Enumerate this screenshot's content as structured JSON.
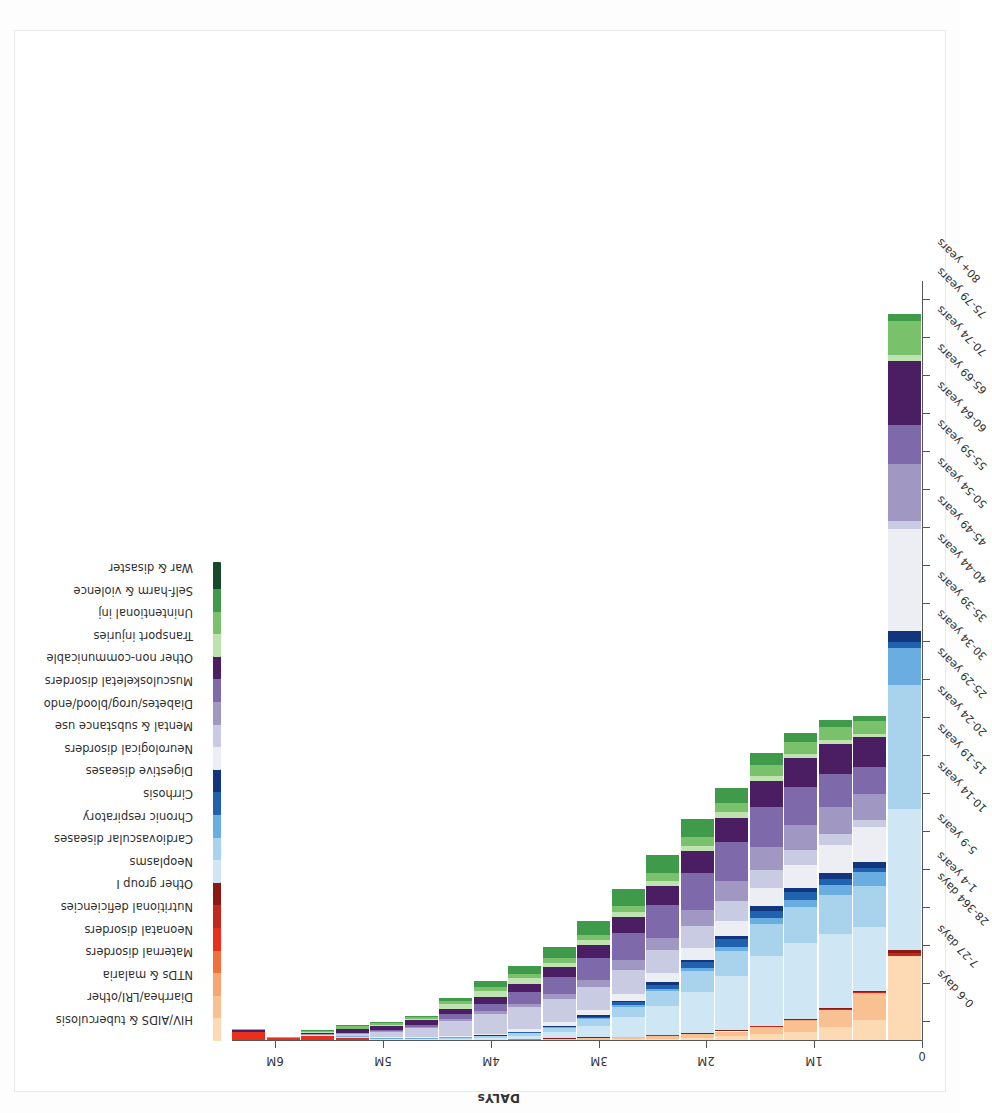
{
  "figure": {
    "title": "Japan, Both sexes, 2010",
    "value_axis_title": "DALYs",
    "value_axis_ticks": [
      "0",
      "1M",
      "2M",
      "3M",
      "4M",
      "5M",
      "6M"
    ]
  },
  "chart_data": {
    "type": "bar",
    "title": "Japan, Both sexes, 2010",
    "xlabel": "",
    "ylabel": "DALYs",
    "ylim": [
      0,
      6400000
    ],
    "grid": false,
    "stacked": true,
    "orientation": "vertical-rotated",
    "legend_position": "top",
    "categories": [
      "0-6 days",
      "7-27 days",
      "28-364 days",
      "1-4 years",
      "5-9 years",
      "10-14 years",
      "15-19 years",
      "20-24 years",
      "25-29 years",
      "30-34 years",
      "35-39 years",
      "40-44 years",
      "45-49 years",
      "50-54 years",
      "55-59 years",
      "60-64 years",
      "65-69 years",
      "70-74 years",
      "75-79 years",
      "80+ years"
    ],
    "series": [
      {
        "name": "HIV/AIDS & tuberculosis",
        "color": "#fdd9b4",
        "values": [
          0,
          0,
          1000,
          2000,
          1000,
          1000,
          2000,
          3000,
          5000,
          7000,
          10000,
          14000,
          20000,
          28000,
          38000,
          55000,
          78000,
          118000,
          178000,
          718000
        ]
      },
      {
        "name": "Diarrhea/LRI/other",
        "color": "#f9c192",
        "values": [
          2000,
          1000,
          5000,
          6000,
          3000,
          3000,
          4000,
          5000,
          7000,
          9000,
          12000,
          16000,
          22000,
          30000,
          42000,
          62000,
          92000,
          140000,
          215000,
          0
        ]
      },
      {
        "name": "NTDs & malaria",
        "color": "#f7a573",
        "values": [
          0,
          0,
          0,
          0,
          0,
          0,
          0,
          0,
          0,
          0,
          1000,
          1000,
          1000,
          2000,
          2000,
          3000,
          4000,
          5000,
          7000,
          0
        ]
      },
      {
        "name": "Maternal disorders",
        "color": "#f2703a",
        "values": [
          0,
          0,
          0,
          0,
          0,
          0,
          1000,
          2000,
          3000,
          4000,
          4000,
          3000,
          2000,
          1000,
          0,
          0,
          0,
          0,
          0,
          0
        ]
      },
      {
        "name": "Neonatal disorders",
        "color": "#e8301c",
        "values": [
          75000,
          22000,
          36000,
          13000,
          1000,
          0,
          0,
          0,
          0,
          0,
          0,
          0,
          0,
          0,
          0,
          0,
          0,
          0,
          0,
          0
        ]
      },
      {
        "name": "Nutritional deficiencies",
        "color": "#c2281b",
        "values": [
          0,
          0,
          1000,
          1000,
          1000,
          1000,
          1000,
          1000,
          1000,
          1000,
          1000,
          1000,
          2000,
          2000,
          3000,
          4000,
          5000,
          7000,
          10000,
          22000
        ]
      },
      {
        "name": "Other group I",
        "color": "#8c1a12",
        "values": [
          0,
          0,
          1000,
          1000,
          1000,
          1000,
          1000,
          1000,
          1000,
          1000,
          2000,
          2000,
          3000,
          3000,
          4000,
          5000,
          7000,
          9000,
          13000,
          30000
        ]
      },
      {
        "name": "Neoplasms",
        "color": "#cfe6f5",
        "values": [
          0,
          0,
          3000,
          9000,
          9000,
          8000,
          11000,
          15000,
          27000,
          52000,
          98000,
          165000,
          245000,
          350000,
          455000,
          590000,
          640000,
          620000,
          540000,
          1180000
        ]
      },
      {
        "name": "Cardiovascular diseases",
        "color": "#a9d2ec",
        "values": [
          0,
          0,
          1000,
          3000,
          3000,
          4000,
          7000,
          12000,
          20000,
          33000,
          55000,
          88000,
          125000,
          170000,
          215000,
          265000,
          300000,
          330000,
          345000,
          1050000
        ]
      },
      {
        "name": "Chronic respiratory",
        "color": "#6aade0",
        "values": [
          0,
          0,
          1000,
          4000,
          5000,
          4000,
          4000,
          4000,
          5000,
          7000,
          10000,
          14000,
          19000,
          26000,
          35000,
          48000,
          65000,
          88000,
          115000,
          310000
        ]
      },
      {
        "name": "Cirrhosis",
        "color": "#1f63b0",
        "values": [
          0,
          0,
          0,
          0,
          0,
          0,
          1000,
          1000,
          3000,
          6000,
          12000,
          22000,
          35000,
          50000,
          62000,
          66000,
          60000,
          48000,
          33000,
          52000
        ]
      },
      {
        "name": "Digestive diseases",
        "color": "#12357e",
        "values": [
          0,
          0,
          1000,
          1000,
          1000,
          1000,
          2000,
          3000,
          5000,
          8000,
          11000,
          15000,
          19000,
          24000,
          29000,
          35000,
          41000,
          47000,
          52000,
          88000
        ]
      },
      {
        "name": "Neurological disorders",
        "color": "#eceef4",
        "values": [
          0,
          0,
          2000,
          6000,
          8000,
          9000,
          12000,
          16000,
          22000,
          30000,
          42000,
          58000,
          78000,
          100000,
          125000,
          155000,
          190000,
          235000,
          290000,
          860000
        ]
      },
      {
        "name": "Mental & substance use",
        "color": "#c8cbe2",
        "values": [
          0,
          0,
          1000,
          12000,
          40000,
          75000,
          125000,
          165000,
          185000,
          195000,
          200000,
          200000,
          195000,
          185000,
          170000,
          150000,
          125000,
          95000,
          65000,
          70000
        ]
      },
      {
        "name": "Diabetes/urog/blood/endo",
        "color": "#a097c2",
        "values": [
          1000,
          0,
          4000,
          9000,
          11000,
          13000,
          17000,
          22000,
          30000,
          42000,
          58000,
          80000,
          105000,
          135000,
          165000,
          195000,
          215000,
          225000,
          215000,
          480000
        ]
      },
      {
        "name": "Musculoskeletal disorders",
        "color": "#7e69aa",
        "values": [
          0,
          0,
          0,
          2000,
          8000,
          18000,
          38000,
          65000,
          100000,
          140000,
          185000,
          230000,
          275000,
          310000,
          330000,
          335000,
          320000,
          285000,
          230000,
          330000
        ]
      },
      {
        "name": "Other non-communicable",
        "color": "#4b1e63",
        "values": [
          14000,
          3000,
          14000,
          30000,
          33000,
          36000,
          45000,
          55000,
          70000,
          88000,
          110000,
          135000,
          160000,
          185000,
          205000,
          225000,
          240000,
          250000,
          250000,
          540000
        ]
      },
      {
        "name": "Transport injuries",
        "color": "#bfe3b0",
        "values": [
          0,
          0,
          1000,
          6000,
          9000,
          11000,
          38000,
          55000,
          45000,
          38000,
          38000,
          40000,
          42000,
          45000,
          45000,
          42000,
          38000,
          35000,
          30000,
          45000
        ]
      },
      {
        "name": "Unintentional inj",
        "color": "#79c26b",
        "values": [
          2000,
          1000,
          10000,
          22000,
          20000,
          18000,
          25000,
          30000,
          33000,
          38000,
          45000,
          55000,
          65000,
          75000,
          82000,
          90000,
          98000,
          105000,
          110000,
          290000
        ]
      },
      {
        "name": "Self-harm & violence",
        "color": "#3f9a4a",
        "values": [
          0,
          0,
          1000,
          2000,
          2000,
          5000,
          25000,
          48000,
          70000,
          90000,
          115000,
          140000,
          150000,
          145000,
          125000,
          100000,
          78000,
          58000,
          42000,
          55000
        ]
      },
      {
        "name": "War & disaster",
        "color": "#15492a",
        "values": [
          0,
          0,
          0,
          0,
          0,
          0,
          0,
          0,
          0,
          0,
          0,
          0,
          0,
          0,
          0,
          0,
          0,
          0,
          0,
          0
        ]
      }
    ]
  }
}
